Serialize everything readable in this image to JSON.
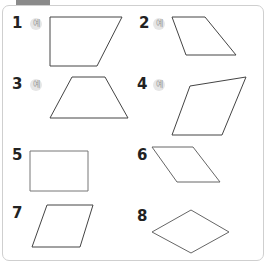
{
  "header": {
    "tab_label": ""
  },
  "badge_label": "예",
  "problems": [
    {
      "number": "1",
      "has_example_badge": true,
      "shape": "trapezoid",
      "points": "50,17 122,17 97,66 50,66"
    },
    {
      "number": "2",
      "has_example_badge": true,
      "shape": "parallelogram",
      "points": "172,17 205,17 236,55 186,55"
    },
    {
      "number": "3",
      "has_example_badge": true,
      "shape": "trapezoid",
      "points": "72,77 105,77 128,118 50,118"
    },
    {
      "number": "4",
      "has_example_badge": true,
      "shape": "quadrilateral",
      "points": "190,86 246,77 222,135 172,135"
    },
    {
      "number": "5",
      "has_example_badge": false,
      "shape": "rectangle",
      "points": "30,151 88,151 88,191 30,191"
    },
    {
      "number": "6",
      "has_example_badge": false,
      "shape": "parallelogram",
      "points": "152,147 193,147 220,182 177,182"
    },
    {
      "number": "7",
      "has_example_badge": false,
      "shape": "parallelogram",
      "points": "47,205 93,205 80,247 32,247"
    },
    {
      "number": "8",
      "has_example_badge": false,
      "shape": "rhombus",
      "points": "191,210 229,232 191,253 152,232"
    }
  ],
  "colors": {
    "stroke_dark": "#333333",
    "stroke_light": "#9a9a9a",
    "frame": "#cfcfcf",
    "tab": "#8a8a8a"
  }
}
